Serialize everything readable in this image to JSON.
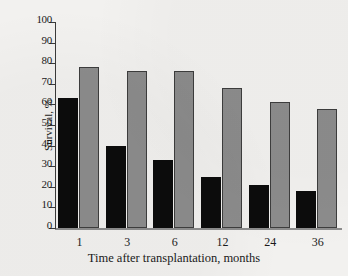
{
  "chart_data": {
    "type": "bar",
    "title": "",
    "xlabel": "Time after transplantation, months",
    "ylabel": "Survival, %",
    "categories": [
      "1",
      "3",
      "6",
      "12",
      "24",
      "36"
    ],
    "ylim": [
      0,
      100
    ],
    "yticks": [
      0,
      10,
      20,
      30,
      40,
      50,
      60,
      70,
      80,
      90,
      100
    ],
    "ytick_labels": [
      "0",
      "10",
      "20",
      "30",
      "40",
      "50",
      "60",
      "70",
      "80",
      "90",
      "100"
    ],
    "grid": false,
    "legend": "none",
    "series": [
      {
        "name": "dark-series",
        "color": "#0c0c0c",
        "values": [
          63,
          40,
          33,
          25,
          21,
          18
        ]
      },
      {
        "name": "gray-series",
        "color": "#8c8c8c",
        "values": [
          78,
          76,
          76,
          68,
          61,
          58
        ]
      }
    ]
  },
  "axis": {
    "y_title": "Survival, %",
    "x_title": "Time after transplantation, months"
  },
  "colors": {
    "dark_bar": "#0c0c0c",
    "gray_bar": "#8c8c8c",
    "bar_outline": "#3d3d3d",
    "axis": "#3a3a3a",
    "background": "#f2f1ef"
  }
}
